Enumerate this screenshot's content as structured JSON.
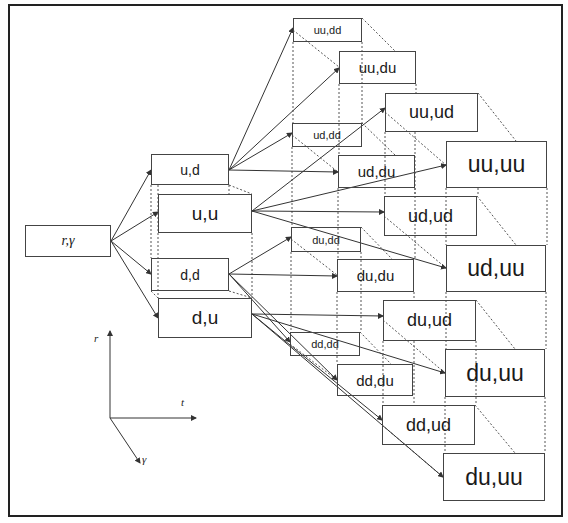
{
  "diagram": {
    "type": "state-transition-lattice",
    "root": {
      "label": "r,γ"
    },
    "level1": [
      {
        "label": "u,d"
      },
      {
        "label": "u,u"
      },
      {
        "label": "d,d"
      },
      {
        "label": "d,u"
      }
    ],
    "level2": [
      {
        "label": "uu,dd"
      },
      {
        "label": "uu,du"
      },
      {
        "label": "uu,ud"
      },
      {
        "label": "uu,uu"
      },
      {
        "label": "ud,dd"
      },
      {
        "label": "ud,du"
      },
      {
        "label": "ud,ud"
      },
      {
        "label": "ud,uu"
      },
      {
        "label": "du,dd"
      },
      {
        "label": "du,du"
      },
      {
        "label": "du,ud"
      },
      {
        "label": "du,uu"
      },
      {
        "label": "dd,dd"
      },
      {
        "label": "dd,du"
      },
      {
        "label": "dd,ud"
      },
      {
        "label": "du,uu"
      }
    ],
    "axes": {
      "r": "r",
      "t": "t",
      "gamma": "γ"
    },
    "colors": {
      "line": "#333333",
      "box_border": "#444444",
      "text": "#1a1a1a"
    }
  }
}
